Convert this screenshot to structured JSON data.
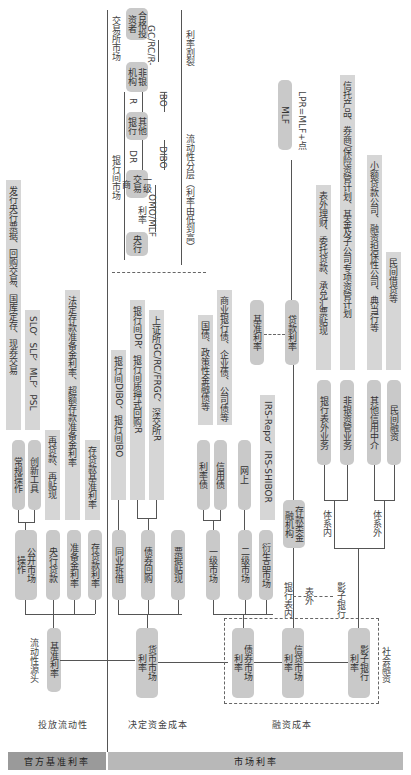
{
  "footer": {
    "official_rate": "官方基准利率",
    "market_rate": "市场利率",
    "release_liquidity": "投放流动性",
    "determine_funding_cost": "决定资金成本",
    "financing_cost": "融资成本"
  },
  "left": {
    "source_label": "流动性源头",
    "benchmark_rate": "基准利率",
    "open_market_ops": "公开市场操作",
    "central_bank_loan": "央行贷款",
    "reserve_rate": "准备金利率",
    "deposit_loan_rate": "存贷款利率",
    "regular_ops": "常规操作",
    "innovative_tools": "创新工具",
    "regular_detail": "发行央行票据、回购交易、国库定存、现券交易",
    "innovative_detail": "SLO、SLF、MLF、PSL",
    "relending": "再贷款、再贴现",
    "reserve_detail": "法定存款准备金利率、超额存款准备金利率",
    "deposit_benchmark": "存贷款基准利率"
  },
  "money_market": {
    "rate": "货币市场利率",
    "interbank_lending": "同业拆借",
    "bond_repo": "债券回购",
    "bill_discount": "票据贴现",
    "lending_detail": "银行间DIBO、银行间IBO",
    "repo_detail_1": "银行间DR、银行间质押式回购R",
    "repo_detail_2": "上证所GC/RC/FRGC、深交所R"
  },
  "bond_market": {
    "rate": "债券市场利率",
    "primary": "一级市场",
    "secondary": "二级市场",
    "derivatives": "衍生品市场",
    "rate_bond": "利率债",
    "credit_bond": "信用债",
    "online": "网上",
    "rate_bond_detail": "国债、政策性金融债等",
    "credit_bond_detail": "商业银行债、企业债、公司债等",
    "irs_detail": "IRS-Repo、IRS-SHIBOR"
  },
  "credit_market": {
    "rate": "信贷市场利率",
    "on_balance": "银行表内",
    "off_balance": "表外",
    "depository": "存款类金融机构",
    "loan_rate": "贷款利率",
    "benchmark": "基准利率",
    "lpr": "LPR=MLF+点",
    "mlf": "MLF"
  },
  "shadow_bank": {
    "rate": "影子银行利率",
    "label": "影子银行",
    "social_financing": "社会融资",
    "in_system": "体系内",
    "out_system": "体系外",
    "bank_off_balance": "银行表外业务",
    "non_bank_am": "非银资管业务",
    "other_credit": "其他信用中介",
    "private_lending": "民间融资",
    "bank_off_detail": "表外理财、委托贷款、承兑汇票贴现",
    "non_bank_detail": "信托产品、券商/保险资管计划、基金及子公司专项资管计划",
    "other_credit_detail": "小额贷款公司、融资担保性公司、典当行等",
    "private_detail": "民间借贷等"
  },
  "liquidity_layers": {
    "interbank_market": "银行间市场",
    "exchange_market": "交易所市场",
    "layer_caption": "流动性分层（利率由低到高）",
    "rate_split": "利率割裂",
    "central_bank": "央行",
    "omo_mlf": "OMO/MLF利率",
    "primary_dealer": "一级交易商",
    "dr": "DR",
    "dibo": "DIBO",
    "other_banks": "其他银行",
    "r": "R",
    "ibo": "IBO",
    "non_bank": "非银机构",
    "gc_rc_r": "GC/RC/R-",
    "qualified_investor": "合格投资者"
  }
}
